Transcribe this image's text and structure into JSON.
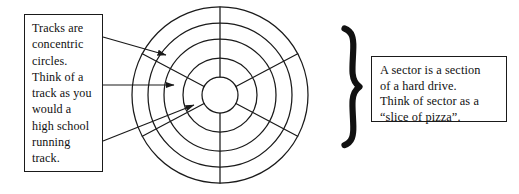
{
  "figure": {
    "background_color": "#ffffff",
    "line_color": "#1a1a1a"
  },
  "left_callout": {
    "name": "tracks-callout",
    "text": "Tracks are\nconcentric\ncircles.\nThink of a\ntrack as you\nwould a\nhigh school\nrunning\ntrack.",
    "lines": [
      "Tracks are",
      "concentric",
      "circles.",
      "Think of a",
      "track as you",
      "would a",
      "high school",
      "running",
      "track."
    ]
  },
  "right_callout": {
    "name": "sectors-callout",
    "text": "A sector is a section\nof a hard drive.\nThink of sector as a\n“slice of pizza”.",
    "lines": [
      "A sector is a section",
      "of a hard drive.",
      "Think of sector as a",
      "“slice of pizza”."
    ]
  },
  "brace": {
    "glyph": "}",
    "points_to": "disk-platter"
  },
  "platter": {
    "center": {
      "x": 220,
      "y": 95
    },
    "track_radii": [
      88,
      72,
      56,
      37,
      18
    ],
    "track_count": 5,
    "sector_boundary_angles_deg": [
      28,
      90,
      152,
      208,
      270,
      332
    ],
    "sector_count": 6
  },
  "arrows": [
    {
      "name": "arrow-to-outer-track",
      "from": {
        "x": 103,
        "y": 37
      },
      "to": {
        "x": 166,
        "y": 55
      },
      "target": "outer-track"
    },
    {
      "name": "arrow-to-middle-track",
      "from": {
        "x": 103,
        "y": 85
      },
      "to": {
        "x": 174,
        "y": 85
      },
      "target": "middle-track"
    },
    {
      "name": "arrow-to-inner-track",
      "from": {
        "x": 103,
        "y": 141
      },
      "to": {
        "x": 194,
        "y": 105
      },
      "target": "inner-track"
    }
  ]
}
